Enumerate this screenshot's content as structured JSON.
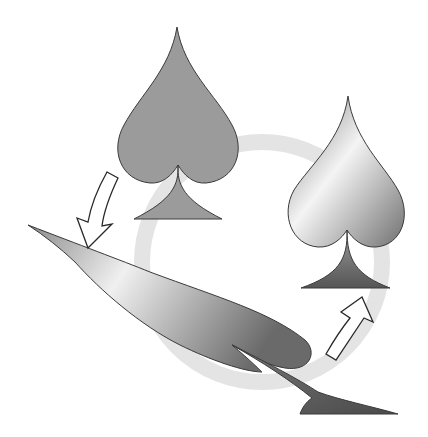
{
  "diagram": {
    "title": "",
    "description": "Cycle of three spade shapes connected by a light gray circular ring and two white outlined arrows",
    "background": "#ffffff",
    "ring": {
      "color": "#e6e6e6",
      "cx": 262,
      "cy": 262,
      "r": 120,
      "width": 16
    },
    "nodes": [
      {
        "id": "flat-spade",
        "label": "",
        "fill": "#9a9a9a",
        "style": "flat gray"
      },
      {
        "id": "shaded-spade",
        "label": "",
        "fill": "gradient",
        "style": "metallic gradient"
      },
      {
        "id": "stretched-spade",
        "label": "",
        "fill": "gradient",
        "style": "distorted / stretched gradient"
      }
    ],
    "arrows": [
      {
        "id": "arrow-flat-to-stretched",
        "from": "flat-spade",
        "to": "stretched-spade",
        "direction": "down-left"
      },
      {
        "id": "arrow-stretched-to-shaded",
        "from": "stretched-spade",
        "to": "shaded-spade",
        "direction": "up-right"
      }
    ],
    "colors": {
      "flat": "#9b9b9b",
      "outline": "#3a3a3a",
      "gradient_light": "#f2f2f2",
      "gradient_dark": "#6e6e6e",
      "stem_dark": "#5a5a5a"
    }
  }
}
